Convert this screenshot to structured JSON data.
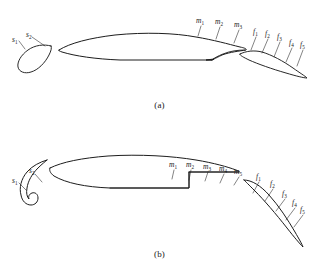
{
  "figure": {
    "background_color": "#ffffff",
    "line_color": "#1d1d1a",
    "text_color": "#1a1a1a"
  },
  "panels": [
    {
      "id": "a",
      "caption": "(a)",
      "elements": [
        {
          "name": "slat",
          "label_prefix": "s"
        },
        {
          "name": "main-element",
          "label_prefix": "m"
        },
        {
          "name": "flap",
          "label_prefix": "f"
        }
      ],
      "slat_labels": [
        {
          "text": "s",
          "sub": "1",
          "x": 12,
          "y": 36
        },
        {
          "text": "s",
          "sub": "2",
          "x": 26,
          "y": 31
        }
      ],
      "main_labels": [
        {
          "text": "m",
          "sub": "1",
          "x": 196,
          "y": 17
        },
        {
          "text": "m",
          "sub": "2",
          "x": 215,
          "y": 18
        },
        {
          "text": "m",
          "sub": "3",
          "x": 234,
          "y": 21
        }
      ],
      "flap_labels": [
        {
          "text": "f",
          "sub": "1",
          "x": 253,
          "y": 28
        },
        {
          "text": "f",
          "sub": "2",
          "x": 265,
          "y": 30
        },
        {
          "text": "f",
          "sub": "3",
          "x": 277,
          "y": 33
        },
        {
          "text": "f",
          "sub": "4",
          "x": 289,
          "y": 39
        },
        {
          "text": "f",
          "sub": "5",
          "x": 300,
          "y": 41
        }
      ]
    },
    {
      "id": "b",
      "caption": "(b)",
      "elements": [
        {
          "name": "slat",
          "label_prefix": "s"
        },
        {
          "name": "main-element",
          "label_prefix": "m"
        },
        {
          "name": "flap",
          "label_prefix": "f"
        }
      ],
      "slat_labels": [
        {
          "text": "s",
          "sub": "1",
          "x": 12,
          "y": 177
        },
        {
          "text": "s",
          "sub": "2",
          "x": 29,
          "y": 167
        }
      ],
      "main_labels": [
        {
          "text": "m",
          "sub": "1",
          "x": 169,
          "y": 161
        },
        {
          "text": "m",
          "sub": "2",
          "x": 186,
          "y": 161
        },
        {
          "text": "m",
          "sub": "3",
          "x": 203,
          "y": 163
        },
        {
          "text": "m",
          "sub": "4",
          "x": 219,
          "y": 165
        },
        {
          "text": "m",
          "sub": "5",
          "x": 234,
          "y": 168
        }
      ],
      "flap_labels": [
        {
          "text": "f",
          "sub": "1",
          "x": 256,
          "y": 173
        },
        {
          "text": "f",
          "sub": "2",
          "x": 270,
          "y": 180
        },
        {
          "text": "f",
          "sub": "3",
          "x": 282,
          "y": 190
        },
        {
          "text": "f",
          "sub": "4",
          "x": 292,
          "y": 199
        },
        {
          "text": "f",
          "sub": "5",
          "x": 300,
          "y": 206
        }
      ]
    }
  ]
}
